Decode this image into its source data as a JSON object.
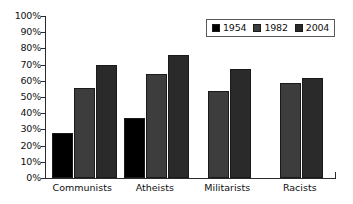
{
  "chart_data": {
    "type": "bar",
    "title": "",
    "subtitle": "",
    "xlabel": "",
    "ylabel": "",
    "ylim": [
      0,
      100
    ],
    "grid": false,
    "legend_position": "top-right",
    "categories": [
      "Communists",
      "Atheists",
      "Militarists",
      "Racists"
    ],
    "y_tick_labels": [
      "100%",
      "90%",
      "80%",
      "70%",
      "60%",
      "50%",
      "40%",
      "30%",
      "20%",
      "10%",
      "0%"
    ],
    "y_tick_values": [
      100,
      90,
      80,
      70,
      60,
      50,
      40,
      30,
      20,
      10,
      0
    ],
    "series": [
      {
        "name": "1954",
        "color": "#000000",
        "values": [
          27.5,
          37,
          null,
          null
        ]
      },
      {
        "name": "1982",
        "color": "#3d3d3d",
        "values": [
          55.5,
          64,
          54,
          58.5
        ]
      },
      {
        "name": "2004",
        "color": "#2a2a2a",
        "values": [
          69.5,
          76,
          67,
          62
        ]
      }
    ]
  },
  "legend": {
    "items": [
      {
        "label": "1954",
        "swatch": "legend-swatch-1954"
      },
      {
        "label": "1982",
        "swatch": "legend-swatch-1982"
      },
      {
        "label": "2004",
        "swatch": "legend-swatch-2004"
      }
    ]
  }
}
